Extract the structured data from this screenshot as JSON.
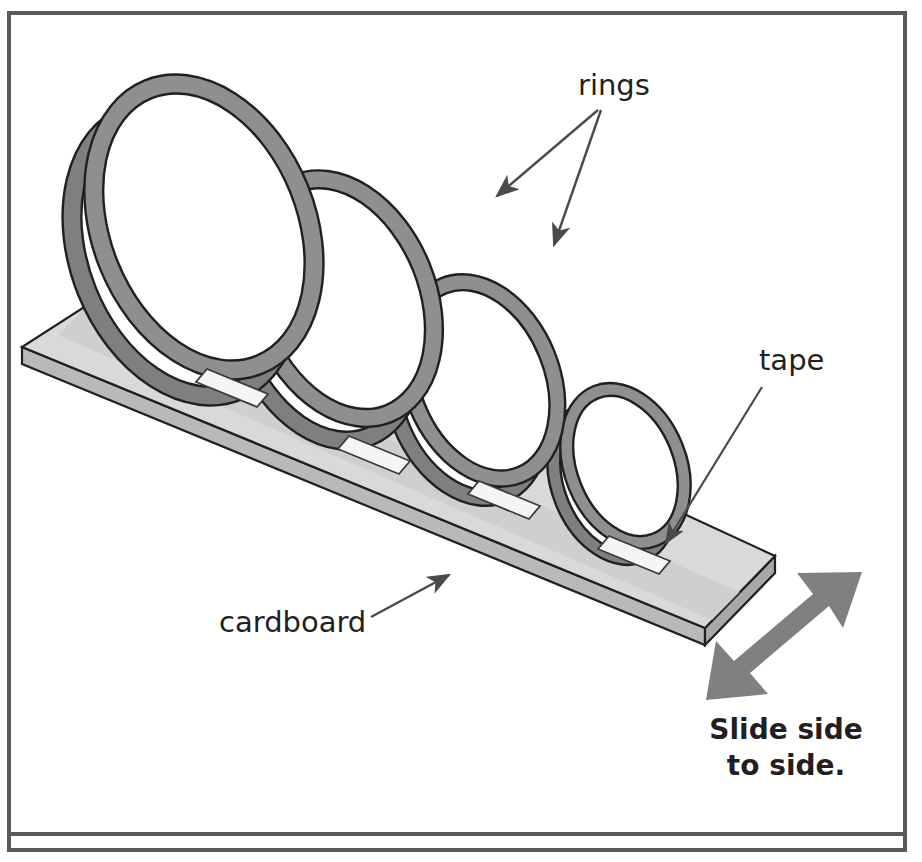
{
  "frame": {
    "border_color": "#5a5a5a",
    "border_width_px": 4,
    "divider_color": "#5a5a5a",
    "background": "#ffffff"
  },
  "labels": {
    "rings": "rings",
    "tape": "tape",
    "cardboard": "cardboard",
    "slide_line1": "Slide side",
    "slide_line2": "to side."
  },
  "colors": {
    "ring_band": "#8f8f8f",
    "ring_band_shade": "#7b7b7b",
    "ring_outline": "#231f20",
    "cardboard_top": "#d9d9d9",
    "cardboard_strip": "#cfcfcf",
    "cardboard_edge": "#b5b5b5",
    "cardboard_outline": "#231f20",
    "tape_fill": "#f2f2f2",
    "tape_outline": "#3a3a3a",
    "arrow_thin": "#4a4a4a",
    "arrow_bold": "#808080",
    "text": "#231f20"
  },
  "objects": {
    "cardboard": {
      "name": "cardboard",
      "shape": "flat rectangular board in isometric perspective",
      "thickness_px": 16
    },
    "rings": {
      "name": "rings",
      "count": 4,
      "description": "paper strips looped into rings, each smaller than the last, standing upright and taped to the board",
      "sizes_relative": [
        1.0,
        0.82,
        0.66,
        0.52
      ]
    },
    "tape": {
      "name": "tape",
      "count": 4,
      "description": "white tape strip holding the base of each ring to the cardboard"
    },
    "motion_arrow": {
      "name": "slide-direction-arrow",
      "type": "double-headed",
      "direction": "diagonal, lower-left to upper-right"
    }
  },
  "annotations": [
    {
      "label": "rings",
      "targets": 2,
      "arrow_style": "thin-line-with-head"
    },
    {
      "label": "tape",
      "targets": 1,
      "arrow_style": "thin-line-with-head"
    },
    {
      "label": "cardboard",
      "targets": 1,
      "arrow_style": "thin-line-with-head"
    }
  ]
}
